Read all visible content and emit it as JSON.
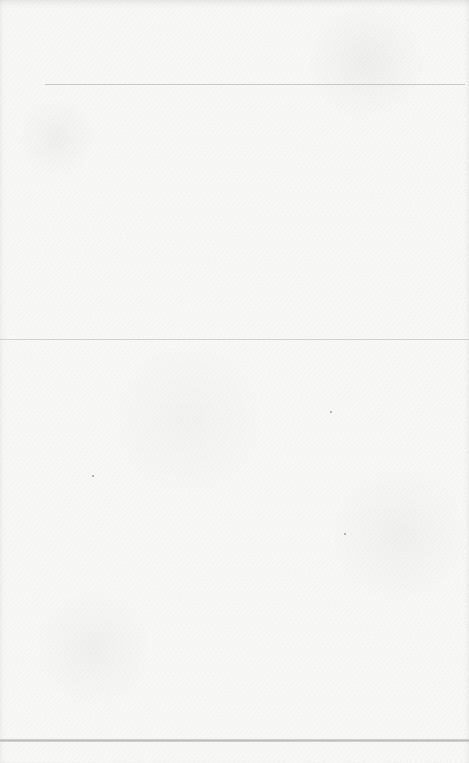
{
  "page": {
    "type": "blank-paper-page",
    "background_color": "#f8f8f7",
    "rules": [
      {
        "name": "top-rule",
        "y": 84,
        "x_start": 45,
        "x_end": 465,
        "color": "#c9c9c7"
      },
      {
        "name": "middle-rule",
        "y": 339,
        "x_start": 0,
        "x_end": 469,
        "color": "#d2d2d0"
      },
      {
        "name": "bottom-rule",
        "y": 740,
        "x_start": 0,
        "x_end": 469,
        "color": "#bdbdbb"
      }
    ],
    "text": ""
  }
}
